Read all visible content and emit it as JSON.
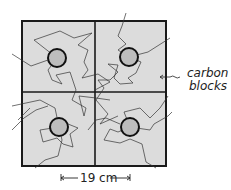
{
  "diagram": {
    "label_blocks": [
      "carbon",
      "blocks"
    ],
    "dimension_label": "19 cm",
    "colors": {
      "block_fill": "#dcdcdc",
      "frame": "#1a1a1a",
      "rod_fill": "#b9b9b9",
      "path": "#333333"
    },
    "rods": [
      {
        "id": "top-left",
        "cx": 57,
        "cy": 58
      },
      {
        "id": "top-right",
        "cx": 129,
        "cy": 57
      },
      {
        "id": "bottom-left",
        "cx": 59,
        "cy": 127
      },
      {
        "id": "bottom-right",
        "cx": 130,
        "cy": 127
      }
    ]
  }
}
